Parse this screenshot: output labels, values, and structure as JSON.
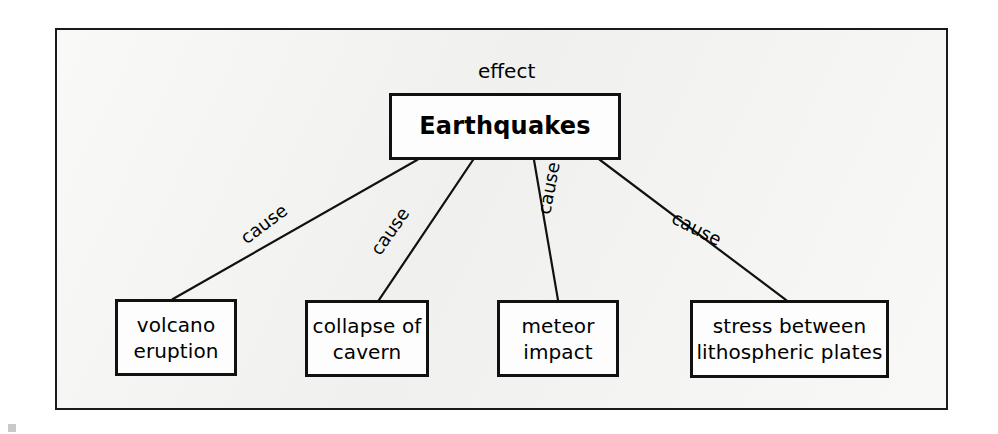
{
  "diagram": {
    "type": "cause-and-effect-concept-map",
    "background_color": "#ffffff",
    "frame_fill": "#f2f2f0",
    "stroke_color": "#111111",
    "effect_label": "effect",
    "root": {
      "id": "earthquakes",
      "label": "Earthquakes",
      "role": "effect"
    },
    "causes": [
      {
        "id": "volcano-eruption",
        "line1": "volcano",
        "line2": "eruption",
        "edge_label": "cause"
      },
      {
        "id": "collapse-of-cavern",
        "line1": "collapse of",
        "line2": "cavern",
        "edge_label": "cause"
      },
      {
        "id": "meteor-impact",
        "line1": "meteor",
        "line2": "impact",
        "edge_label": "cause"
      },
      {
        "id": "stress-between-lithospheric-plates",
        "line1": "stress between",
        "line2": "lithospheric plates",
        "edge_label": "cause"
      }
    ],
    "edges": [
      {
        "from": "earthquakes",
        "to": "volcano-eruption",
        "label": "cause"
      },
      {
        "from": "earthquakes",
        "to": "collapse-of-cavern",
        "label": "cause"
      },
      {
        "from": "earthquakes",
        "to": "meteor-impact",
        "label": "cause"
      },
      {
        "from": "earthquakes",
        "to": "stress-between-lithospheric-plates",
        "label": "cause"
      }
    ]
  }
}
